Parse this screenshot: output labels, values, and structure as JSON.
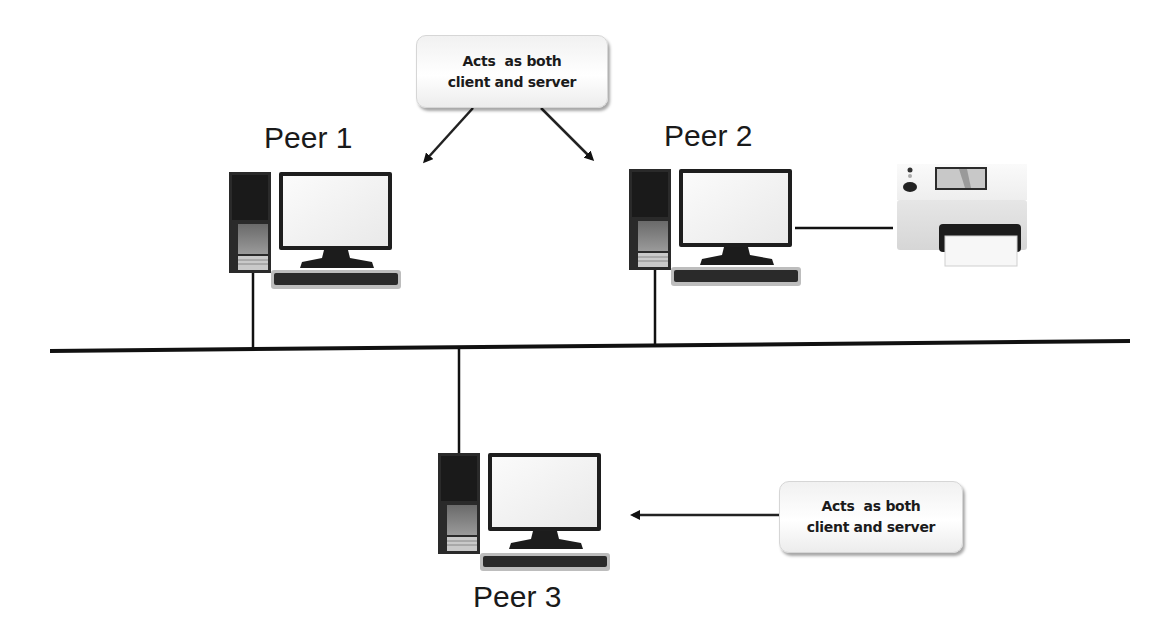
{
  "diagram": {
    "nodes": [
      {
        "id": "peer1",
        "label": "Peer 1",
        "type": "computer"
      },
      {
        "id": "peer2",
        "label": "Peer 2",
        "type": "computer"
      },
      {
        "id": "peer3",
        "label": "Peer 3",
        "type": "computer"
      },
      {
        "id": "printer",
        "label": "",
        "type": "printer"
      }
    ],
    "callouts": [
      {
        "line1": "Acts  as both",
        "line2": "client and server",
        "points_to": [
          "peer1",
          "peer2"
        ]
      },
      {
        "line1": "Acts  as both",
        "line2": "client and server",
        "points_to": [
          "peer3"
        ]
      }
    ],
    "connections": [
      {
        "from": "peer1",
        "to": "bus"
      },
      {
        "from": "peer2",
        "to": "bus"
      },
      {
        "from": "peer3",
        "to": "bus"
      },
      {
        "from": "peer2",
        "to": "printer"
      }
    ],
    "colors": {
      "line": "#111111",
      "background": "#ffffff",
      "callout_fill": "#f4f4f4"
    }
  }
}
